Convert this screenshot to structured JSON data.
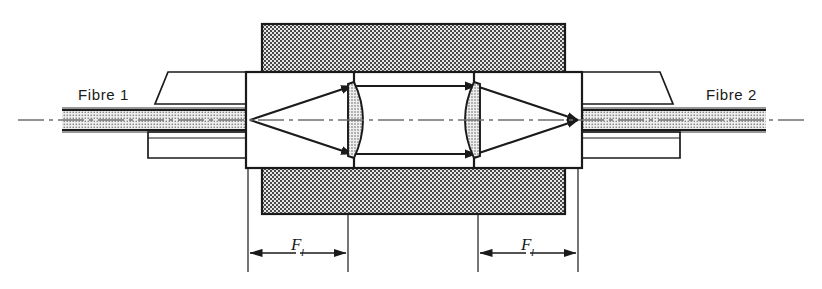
{
  "figure": {
    "background_color": "#ffffff",
    "line_color": "#1a1a1a",
    "hatch_fill_color": "#b8b8b8",
    "stipple_fill_color": "#c9c9c9",
    "width": 822,
    "height": 289
  },
  "labels": {
    "fibre_left": "Fibre 1",
    "fibre_right": "Fibre 2",
    "dimension_left_symbol": "F",
    "dimension_left_subscript": "l",
    "dimension_right_symbol": "F",
    "dimension_right_subscript": "l"
  },
  "components": {
    "housing_top": {
      "name": "housing-block-top",
      "x": 262,
      "y": 24,
      "width": 303,
      "height": 48
    },
    "housing_bottom": {
      "name": "housing-block-bottom",
      "x": 262,
      "y": 168,
      "width": 303,
      "height": 46
    },
    "barrel_left": {
      "name": "lens-barrel-left",
      "x": 246,
      "y": 72,
      "width": 108,
      "height": 96
    },
    "barrel_right": {
      "name": "lens-barrel-right",
      "x": 474,
      "y": 72,
      "width": 108,
      "height": 96
    },
    "lens_left": {
      "name": "plano-convex-lens-left",
      "x": 348,
      "y": 84,
      "width": 20,
      "height": 72
    },
    "lens_right": {
      "name": "plano-convex-lens-right",
      "x": 460,
      "y": 84,
      "width": 20,
      "height": 72
    },
    "fibre_left_cable": {
      "name": "fibre-cable-left",
      "x": 62,
      "y": 110,
      "width": 188,
      "height": 20
    },
    "fibre_right_cable": {
      "name": "fibre-cable-right",
      "x": 578,
      "y": 110,
      "width": 188,
      "height": 20
    },
    "optical_axis_y": 120
  },
  "dimensions": {
    "arrow_row_y": 253,
    "left": {
      "from_x": 248,
      "to_x": 348
    },
    "right": {
      "from_x": 478,
      "to_x": 578
    }
  }
}
